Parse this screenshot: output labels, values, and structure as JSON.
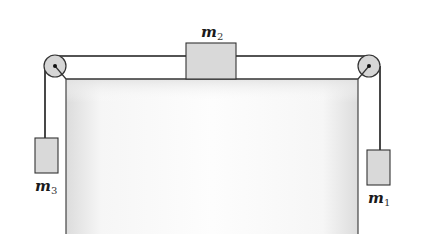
{
  "diagram": {
    "type": "pulley-system",
    "colors": {
      "background": "#ffffff",
      "line": "#1a1a1a",
      "block_fill": "#d9d9d9",
      "block_stroke": "#333333",
      "table_fill_edge": "#dedede",
      "table_fill_center": "#fbfbfb",
      "table_stroke": "#444444",
      "pulley_fill": "#d4d4d4"
    },
    "masses": [
      {
        "id": "m1",
        "symbol": "m",
        "subscript": "1",
        "position": "hanging right"
      },
      {
        "id": "m2",
        "symbol": "m",
        "subscript": "2",
        "position": "on table top"
      },
      {
        "id": "m3",
        "symbol": "m",
        "subscript": "3",
        "position": "hanging left"
      }
    ],
    "pulleys": [
      {
        "id": "left-pulley",
        "position": "top-left corner of table"
      },
      {
        "id": "right-pulley",
        "position": "top-right corner of table"
      }
    ],
    "labels": {
      "m1": {
        "base": "m",
        "sub": "1"
      },
      "m2": {
        "base": "m",
        "sub": "2"
      },
      "m3": {
        "base": "m",
        "sub": "3"
      }
    }
  }
}
